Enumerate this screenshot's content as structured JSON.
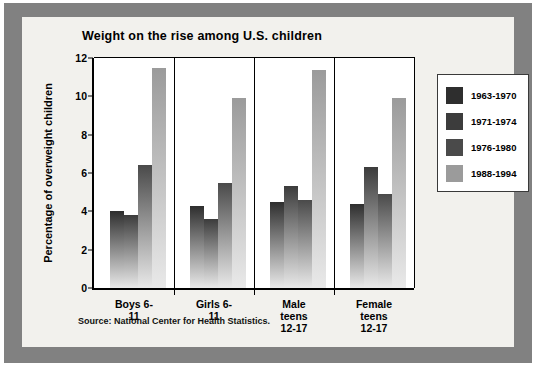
{
  "frame": {
    "mat_color": "#818181",
    "panel_color": "#f2f1ed"
  },
  "source_note": "Source: National Center for Health Statistics.",
  "chart_data": {
    "type": "bar",
    "title": "Weight on the rise among U.S. children",
    "xlabel": "",
    "ylabel": "Percentage of overweight children",
    "ylim": [
      0,
      12
    ],
    "yticks": [
      0,
      2,
      4,
      6,
      8,
      10,
      12
    ],
    "ytick_labels": [
      "0",
      "2",
      "4",
      "6",
      "8",
      "10",
      "12"
    ],
    "grid": false,
    "legend_position": "right",
    "categories": [
      "Boys 6-11",
      "Girls 6-11",
      "Male teens\n12-17",
      "Female teens\n12-17"
    ],
    "series": [
      {
        "name": "1963-1970",
        "color": "#2e2e2e",
        "values": [
          4.0,
          4.3,
          4.5,
          4.4
        ]
      },
      {
        "name": "1971-1974",
        "color": "#3c3c3c",
        "values": [
          3.8,
          3.6,
          5.3,
          6.3
        ]
      },
      {
        "name": "1976-1980",
        "color": "#4a4a4a",
        "values": [
          6.4,
          5.5,
          4.6,
          4.9
        ]
      },
      {
        "name": "1988-1994",
        "color": "#9b9b9b",
        "values": [
          11.5,
          9.9,
          11.4,
          9.9
        ]
      }
    ]
  }
}
